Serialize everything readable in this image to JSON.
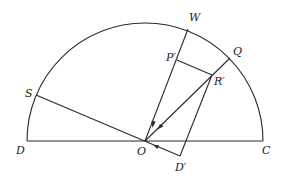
{
  "diagram": {
    "type": "geometry-semicircle",
    "stroke_color": "#2a2a2a",
    "background": "#ffffff",
    "center": {
      "x": 145,
      "y": 141
    },
    "radius": 118,
    "points": {
      "D": {
        "x": 27,
        "y": 141
      },
      "C": {
        "x": 263,
        "y": 141
      },
      "O": {
        "x": 145,
        "y": 141
      },
      "S": {
        "x": 36,
        "y": 95
      },
      "W": {
        "x": 188,
        "y": 29
      },
      "Q": {
        "x": 230,
        "y": 58
      },
      "P_prime": {
        "x": 177,
        "y": 60
      },
      "R_prime": {
        "x": 212,
        "y": 75
      },
      "D_prime": {
        "x": 180,
        "y": 156
      }
    },
    "labels": [
      {
        "id": "W",
        "text": "W",
        "x": 189,
        "y": 21
      },
      {
        "id": "Q",
        "text": "Q",
        "x": 233,
        "y": 55
      },
      {
        "id": "P_prime",
        "text": "P′",
        "x": 166,
        "y": 61
      },
      {
        "id": "R_prime",
        "text": "R′",
        "x": 214,
        "y": 85
      },
      {
        "id": "S",
        "text": "S",
        "x": 25,
        "y": 97
      },
      {
        "id": "D",
        "text": "D",
        "x": 16,
        "y": 154
      },
      {
        "id": "O",
        "text": "O",
        "x": 137,
        "y": 155
      },
      {
        "id": "C",
        "text": "C",
        "x": 262,
        "y": 154
      },
      {
        "id": "D_prime",
        "text": "D′",
        "x": 175,
        "y": 171
      }
    ],
    "segments": [
      {
        "from": "D",
        "to": "C",
        "name": "diameter-DC"
      },
      {
        "from": "S",
        "to": "D_prime",
        "name": "line-S-O-Dprime"
      },
      {
        "from": "W",
        "to": "O",
        "name": "line-W-O",
        "arrow": "toward-O"
      },
      {
        "from": "Q",
        "to": "O",
        "name": "line-Q-O",
        "arrow": "toward-O"
      },
      {
        "from": "P_prime",
        "to": "R_prime",
        "name": "segment-Pprime-Rprime"
      },
      {
        "from": "R_prime",
        "to": "D_prime",
        "name": "segment-Rprime-Dprime"
      }
    ]
  }
}
